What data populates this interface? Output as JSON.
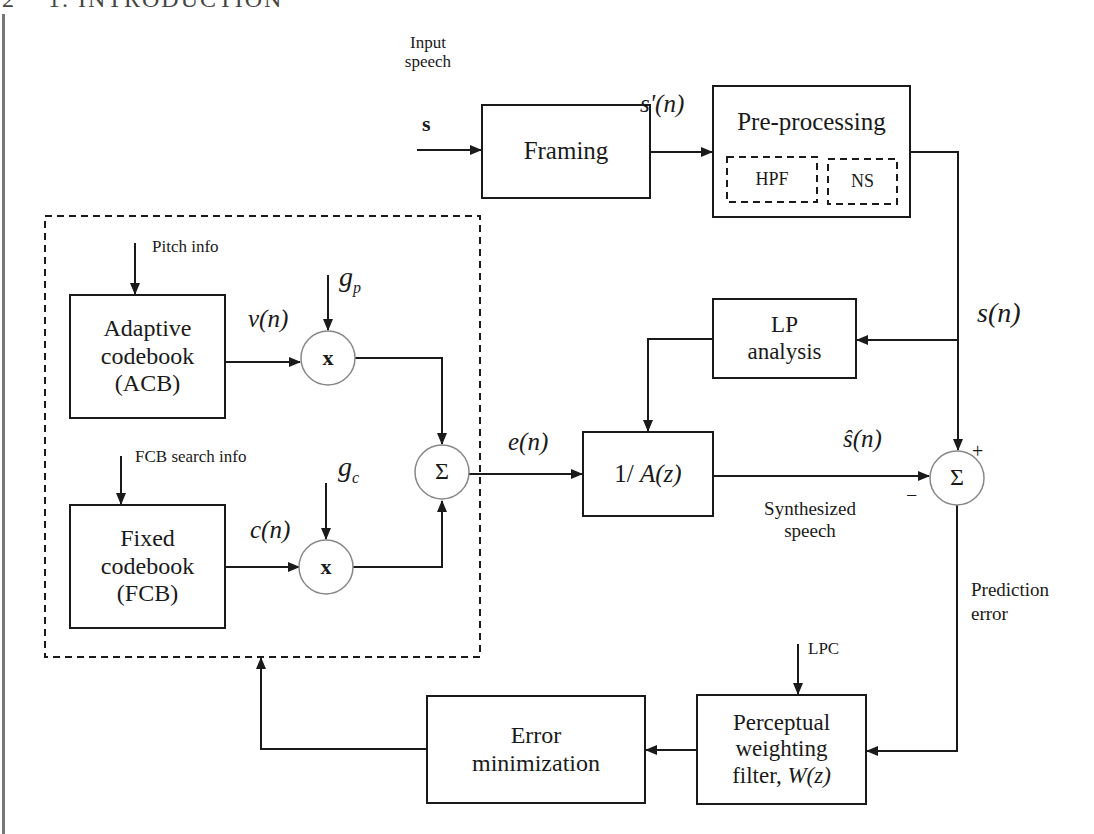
{
  "page": {
    "page_number": "2",
    "running_header": "1. INTRODUCTION"
  },
  "inputs": {
    "input_label_line1": "Input",
    "input_label_line2": "speech",
    "input_symbol": "s",
    "s_prime": "s'(n)",
    "s_n": "s(n)",
    "s_hat": "ŝ(n)",
    "e_n": "e(n)",
    "v_n": "v(n)",
    "c_n": "c(n)",
    "g_p": "g",
    "g_p_sub": "p",
    "g_c": "g",
    "g_c_sub": "c",
    "plus": "+",
    "minus": "−"
  },
  "blocks": {
    "framing": "Framing",
    "preprocessing": "Pre-processing",
    "hpf": "HPF",
    "ns": "NS",
    "acb_line1": "Adaptive",
    "acb_line2": "codebook",
    "acb_line3": "(ACB)",
    "fcb_line1": "Fixed",
    "fcb_line2": "codebook",
    "fcb_line3": "(FCB)",
    "lp_line1": "LP",
    "lp_line2": "analysis",
    "synth_filter_prefix": "1/ ",
    "synth_filter_math": "A(z)",
    "error_line1": "Error",
    "error_line2": "minimization",
    "pw_line1": "Perceptual",
    "pw_line2": "weighting",
    "pw_line3_prefix": "filter, ",
    "pw_line3_math": "W(z)"
  },
  "operators": {
    "multiply": "x",
    "sum": "Σ"
  },
  "annotations": {
    "pitch_info": "Pitch info",
    "fcb_search_info": "FCB search info",
    "synthesized_line1": "Synthesized",
    "synthesized_line2": "speech",
    "prediction_line1": "Prediction",
    "prediction_line2": "error",
    "lpc": "LPC"
  }
}
